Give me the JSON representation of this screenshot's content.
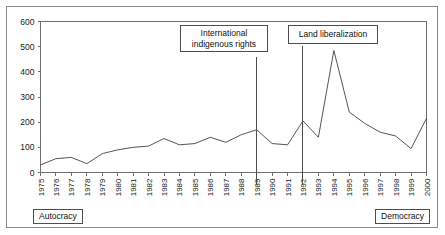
{
  "chart_data": {
    "type": "line",
    "title": "",
    "xlabel": "",
    "ylabel": "",
    "ylim": [
      0,
      600
    ],
    "yticks": [
      0,
      100,
      200,
      300,
      400,
      500,
      600
    ],
    "grid": false,
    "legend": "none",
    "categories": [
      "1975",
      "1976",
      "1977",
      "1978",
      "1979",
      "1980",
      "1981",
      "1982",
      "1983",
      "1984",
      "1985",
      "1986",
      "1987",
      "1988",
      "1989",
      "1990",
      "1991",
      "1992",
      "1993",
      "1994",
      "1995",
      "1996",
      "1997",
      "1998",
      "1999",
      "2000"
    ],
    "series": [
      {
        "name": "count",
        "values": [
          30,
          55,
          60,
          35,
          75,
          90,
          100,
          105,
          135,
          110,
          115,
          140,
          120,
          150,
          170,
          115,
          110,
          205,
          140,
          485,
          240,
          195,
          160,
          145,
          95,
          215
        ]
      }
    ],
    "annotations": [
      {
        "label": "International\nindigenous rights",
        "line1": "International",
        "line2": "indigenous rights",
        "at_year": "1989"
      },
      {
        "label": "Land liberalization",
        "line1": "Land liberalization",
        "line2": "",
        "at_year": "1992"
      }
    ],
    "regime_labels": {
      "left": "Autocracy",
      "right": "Democracy"
    }
  },
  "axis": {
    "y_ticks": [
      "0",
      "100",
      "200",
      "300",
      "400",
      "500",
      "600"
    ],
    "x_ticks": [
      "1975",
      "1976",
      "1977",
      "1978",
      "1979",
      "1980",
      "1981",
      "1982",
      "1983",
      "1984",
      "1985",
      "1986",
      "1987",
      "1988",
      "1989",
      "1990",
      "1991",
      "1992",
      "1993",
      "1994",
      "1995",
      "1996",
      "1997",
      "1998",
      "1999",
      "2000"
    ]
  },
  "callouts": {
    "indigenous_line1": "International",
    "indigenous_line2": "indigenous rights",
    "land_line1": "Land liberalization"
  },
  "regime": {
    "autocracy": "Autocracy",
    "democracy": "Democracy"
  },
  "colors": {
    "line": "#555555",
    "axis": "#6e6e6e",
    "frame": "#8a8a8a",
    "text": "#1a1a1a",
    "background": "#ffffff"
  }
}
